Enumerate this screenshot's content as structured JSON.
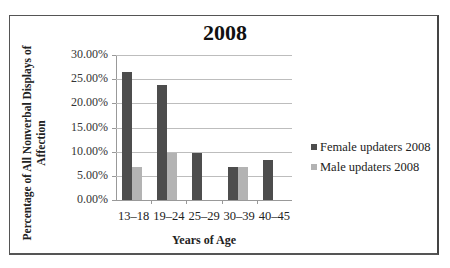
{
  "chart_data": {
    "type": "bar",
    "title": "2008",
    "xlabel": "Years of Age",
    "ylabel": "Percentage of All Nonverbal Displays of Affection",
    "categories": [
      "13–18",
      "19–24",
      "25–29",
      "30–39",
      "40–45"
    ],
    "series": [
      {
        "name": "Female updaters 2008",
        "color": "#4d4d4d",
        "values": [
          26.5,
          23.8,
          9.8,
          6.9,
          8.3
        ]
      },
      {
        "name": "Male updaters 2008",
        "color": "#b3b3b3",
        "values": [
          6.9,
          9.7,
          0,
          6.9,
          0
        ]
      }
    ],
    "ylim": [
      0,
      30
    ],
    "yticks": [
      "0.00%",
      "5.00%",
      "10.00%",
      "15.00%",
      "20.00%",
      "25.00%",
      "30.00%"
    ],
    "grid": true,
    "legend_position": "right"
  },
  "title": "2008",
  "ylabel_line1": "Percentage of All Nonverbal Displays of",
  "ylabel_line2": "Affection",
  "xlabel": "Years of Age",
  "legend": {
    "female": "Female updaters 2008",
    "male": "Male updaters 2008"
  }
}
